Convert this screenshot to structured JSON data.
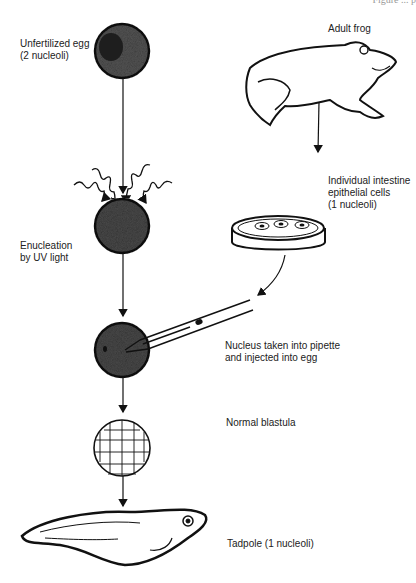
{
  "header": {
    "partial_text": "Figure ... p"
  },
  "labels": {
    "unfertilized_egg": [
      "Unfertilized egg",
      "(2 nucleoli)"
    ],
    "adult_frog": "Adult frog",
    "intestine_cells": [
      "Individual intestine",
      "epithelial cells",
      "(1 nucleoli)"
    ],
    "enucleation": [
      "Enucleation",
      "by UV light"
    ],
    "nucleus_injection": [
      "Nucleus taken into pipette",
      "and injected into egg"
    ],
    "blastula": "Normal blastula",
    "tadpole": "Tadpole (1 nucleoli)"
  },
  "colors": {
    "ink": "#111111",
    "egg_fill": "#3a3a3a",
    "background": "#ffffff"
  }
}
